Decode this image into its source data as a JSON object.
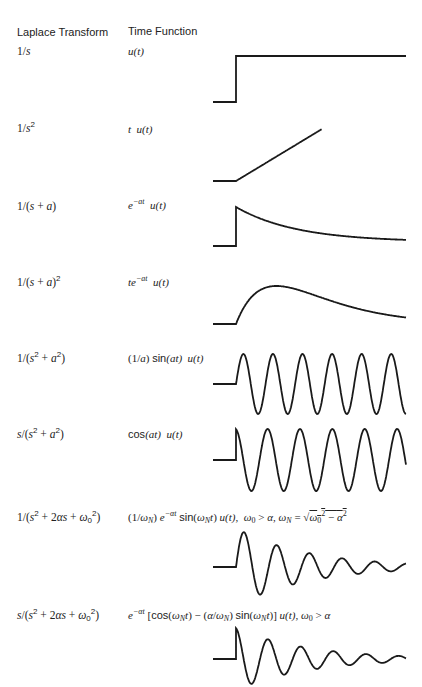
{
  "page_header_fragment": "",
  "table": {
    "headers": {
      "laplace": "Laplace Transform",
      "time": "Time Function"
    },
    "rows": [
      {
        "laplace": "1/s",
        "time": "u(t)",
        "plot": "step"
      },
      {
        "laplace": "1/s²",
        "time": "t u(t)",
        "plot": "ramp"
      },
      {
        "laplace": "1/(s + a)",
        "time": "e^(−at) u(t)",
        "plot": "exp-decay"
      },
      {
        "laplace": "1/(s + a)²",
        "time": "te^(−at) u(t)",
        "plot": "t-exp-decay"
      },
      {
        "laplace": "1/(s² + a²)",
        "time": "(1/a) sin(at) u(t)",
        "plot": "sine"
      },
      {
        "laplace": "s/(s² + a²)",
        "time": "cos(at) u(t)",
        "plot": "cosine"
      },
      {
        "laplace": "1/(s² + 2αs + ω0²)",
        "time": "(1/ωN) e^(−αt) sin(ωN t) u(t), ω0 > α, ωN = √(ω0² − α²)",
        "plot": "damped-sine"
      },
      {
        "laplace": "s/(s² + 2αs + ω0²)",
        "time": "e^(−αt) [cos(ωN t) − (α/ωN) sin(ωN t)] u(t), ω0 > α",
        "plot": "damped-cosine"
      }
    ]
  }
}
